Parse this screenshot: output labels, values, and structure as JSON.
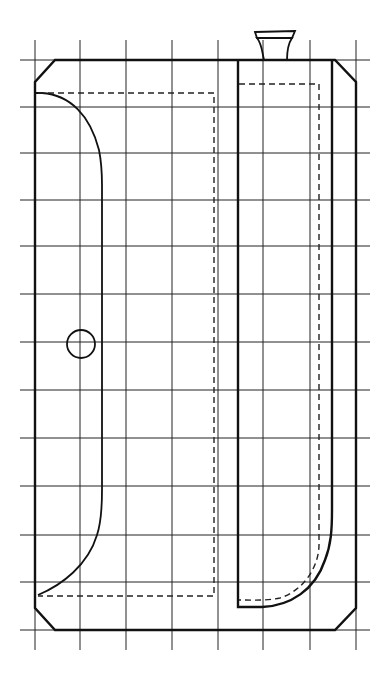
{
  "diagram": {
    "type": "technical-line-drawing",
    "colors": {
      "background": "#ffffff",
      "ink": "#111111"
    },
    "grid": {
      "vertical_x": [
        35,
        80,
        126,
        172,
        218,
        263,
        310,
        356
      ],
      "vertical_y_range": [
        40,
        650
      ],
      "horizontal_y": [
        60,
        107,
        153,
        200,
        246,
        294,
        342,
        390,
        438,
        486,
        535,
        582,
        630
      ],
      "horizontal_x_range": [
        20,
        370
      ]
    },
    "outer_body": {
      "points": "55,60 335,60 356,82 356,608 335,630 55,630 35,608 35,82"
    },
    "left_compartment_curve": "M35,93 L42,93 C70,95 90,115 99,150 C102,165 102,175 102,185 L102,490 C102,500 102,520 97,535 C88,565 62,585 38,595",
    "left_dashed_box": "M38,93 L214,93 L214,596 L38,596",
    "right_compartment": "M238,60 L238,607 L262,607 C290,606 315,590 325,560 C331,545 332,530 332,510 L332,60",
    "right_dashed_inner": "M239,84 L319,84 L319,545 C319,565 305,590 280,598 C265,601 250,600 239,600",
    "spout": {
      "neck": "M264,60 C262,52 262,44 257,38 L292,38 C288,44 287,52 287,60",
      "cap": "M255,32 L295,31 L292,38 L257,38 Z"
    },
    "circle_feature": {
      "cx": 81,
      "cy": 344,
      "r": 14
    }
  }
}
